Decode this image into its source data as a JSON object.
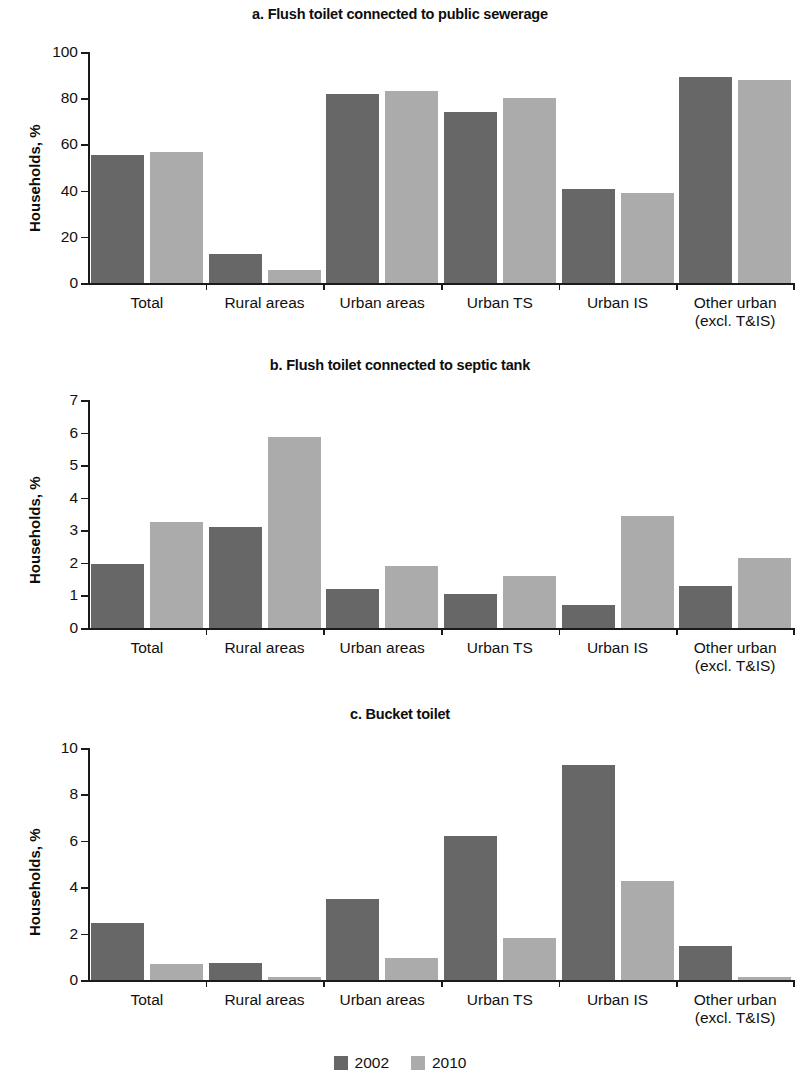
{
  "figure": {
    "series_colors": {
      "s2002": "#676767",
      "s2010": "#ababab"
    },
    "y_axis_label": "Households, %",
    "legend": [
      {
        "label": "2002",
        "color": "#676767",
        "swatch": "square-swatch"
      },
      {
        "label": "2010",
        "color": "#ababab",
        "swatch": "square-swatch"
      }
    ],
    "categories": [
      {
        "line1": "Total",
        "line2": ""
      },
      {
        "line1": "Rural areas",
        "line2": ""
      },
      {
        "line1": "Urban areas",
        "line2": ""
      },
      {
        "line1": "Urban TS",
        "line2": ""
      },
      {
        "line1": "Urban IS",
        "line2": ""
      },
      {
        "line1": "Other urban",
        "line2": "(excl. T&IS)"
      }
    ]
  },
  "chart_data": [
    {
      "type": "bar",
      "title": "a. Flush toilet connected to public sewerage",
      "xlabel": "",
      "ylabel": "Households, %",
      "ylim": [
        0,
        100
      ],
      "yticks": [
        0,
        20,
        40,
        60,
        80,
        100
      ],
      "ytick_labels": [
        "0",
        "20",
        "40",
        "60",
        "80",
        "100"
      ],
      "grid": false,
      "legend_position": "bottom",
      "categories": [
        "Total",
        "Rural areas",
        "Urban areas",
        "Urban TS",
        "Urban IS",
        "Other urban (excl. T&IS)"
      ],
      "series": [
        {
          "name": "2002",
          "values": [
            55.5,
            12.5,
            82.0,
            74.0,
            40.5,
            89.0
          ]
        },
        {
          "name": "2010",
          "values": [
            56.5,
            5.5,
            83.0,
            80.0,
            39.0,
            88.0
          ]
        }
      ]
    },
    {
      "type": "bar",
      "title": "b. Flush toilet connected to septic tank",
      "xlabel": "",
      "ylabel": "Households, %",
      "ylim": [
        0,
        7
      ],
      "yticks": [
        0,
        1,
        2,
        3,
        4,
        5,
        6,
        7
      ],
      "ytick_labels": [
        "0",
        "1",
        "2",
        "3",
        "4",
        "5",
        "6",
        "7"
      ],
      "grid": false,
      "legend_position": "bottom",
      "categories": [
        "Total",
        "Rural areas",
        "Urban areas",
        "Urban TS",
        "Urban IS",
        "Other urban (excl. T&IS)"
      ],
      "series": [
        {
          "name": "2002",
          "values": [
            1.95,
            3.1,
            1.2,
            1.05,
            0.7,
            1.3
          ]
        },
        {
          "name": "2010",
          "values": [
            3.25,
            5.85,
            1.9,
            1.6,
            3.45,
            2.15
          ]
        }
      ]
    },
    {
      "type": "bar",
      "title": "c. Bucket toilet",
      "xlabel": "",
      "ylabel": "Households, %",
      "ylim": [
        0,
        10
      ],
      "yticks": [
        0,
        2,
        4,
        6,
        8,
        10
      ],
      "ytick_labels": [
        "0",
        "2",
        "4",
        "6",
        "8",
        "10"
      ],
      "grid": false,
      "legend_position": "bottom",
      "categories": [
        "Total",
        "Rural areas",
        "Urban areas",
        "Urban TS",
        "Urban IS",
        "Other urban (excl. T&IS)"
      ],
      "series": [
        {
          "name": "2002",
          "values": [
            2.45,
            0.75,
            3.5,
            6.2,
            9.25,
            1.45
          ]
        },
        {
          "name": "2010",
          "values": [
            0.7,
            0.15,
            0.95,
            1.8,
            4.25,
            0.15
          ]
        }
      ]
    }
  ]
}
